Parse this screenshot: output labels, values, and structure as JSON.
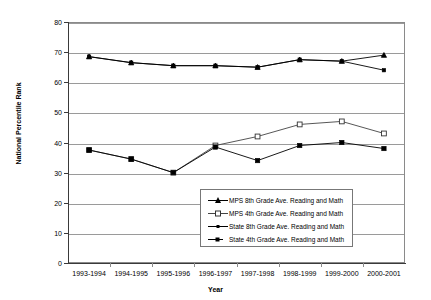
{
  "chart_data": {
    "type": "line",
    "title": "",
    "xlabel": "Year",
    "ylabel": "National Percentile Rank",
    "ylim": [
      0,
      80
    ],
    "ytick_step": 10,
    "yticks": [
      "0",
      "10",
      "20",
      "30",
      "40",
      "50",
      "60",
      "70",
      "80"
    ],
    "grid": true,
    "legend_position": "inside-center-lower",
    "categories": [
      "1993-1994",
      "1994-1995",
      "1995-1996",
      "1996-1997",
      "1997-1998",
      "1998-1999",
      "1999-2000",
      "2000-2001"
    ],
    "series": [
      {
        "name": "MPS 8th Grade Ave. Reading and Math",
        "marker": "triangle",
        "marker_filled": true,
        "color": "#000000",
        "values": [
          68.5,
          66.5,
          65.5,
          65.5,
          65,
          67.5,
          67,
          69
        ]
      },
      {
        "name": "MPS 4th Grade Ave. Reading and Math",
        "marker": "square-open",
        "marker_filled": false,
        "color": "#444444",
        "values": [
          37.5,
          34.5,
          30,
          39,
          42,
          46,
          47,
          43
        ]
      },
      {
        "name": "State 8th Grade Ave. Reading and Math",
        "marker": "square-small",
        "marker_filled": true,
        "color": "#000000",
        "values": [
          68.5,
          66.5,
          65.5,
          65.5,
          65,
          67.5,
          67,
          64
        ]
      },
      {
        "name": "State 4th Grade Ave. Reading and Math",
        "marker": "square",
        "marker_filled": true,
        "color": "#000000",
        "values": [
          37.5,
          34.5,
          30,
          38.5,
          34,
          39,
          40,
          38
        ]
      }
    ]
  },
  "axes": {
    "y_title": "National Percentile Rank",
    "x_title": "Year"
  },
  "legend": {
    "items": [
      {
        "label": "MPS 8th Grade Ave. Reading and Math"
      },
      {
        "label": "MPS 4th Grade Ave. Reading and Math"
      },
      {
        "label": "State 8th Grade Ave. Reading and Math"
      },
      {
        "label": "State 4th Grade Ave. Reading and Math"
      }
    ]
  }
}
